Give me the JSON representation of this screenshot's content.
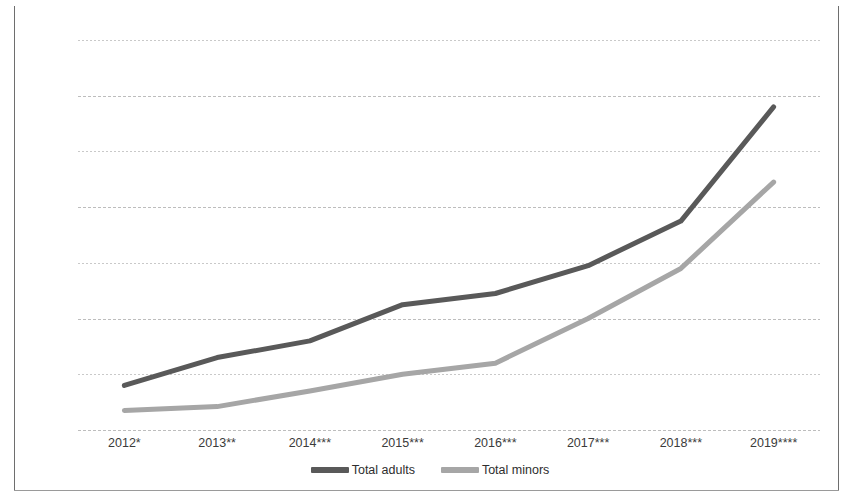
{
  "chart_data": {
    "type": "line",
    "title": "",
    "xlabel": "",
    "ylabel": "",
    "categories": [
      "2012*",
      "2013**",
      "2014***",
      "2015***",
      "2016***",
      "2017***",
      "2018***",
      "2019****"
    ],
    "series": [
      {
        "name": "Total adults",
        "color": "#595959",
        "values": [
          800,
          1300,
          1600,
          2250,
          2450,
          2950,
          3750,
          5800
        ]
      },
      {
        "name": "Total minors",
        "color": "#a6a6a6",
        "values": [
          350,
          420,
          700,
          1000,
          1200,
          2000,
          2900,
          4450
        ]
      }
    ],
    "ylim": [
      0,
      7000
    ],
    "yticks": [
      "0",
      "1000",
      "2000",
      "3000",
      "4000",
      "5000",
      "6000",
      "7000"
    ],
    "ytick_values": [
      0,
      1000,
      2000,
      3000,
      4000,
      5000,
      6000,
      7000
    ],
    "grid": true,
    "legend_position": "bottom-center"
  },
  "colors": {
    "grid": "#c9c9c9",
    "border": "#6e6e6e",
    "text": "#3b3b3b",
    "background": "#ffffff"
  }
}
